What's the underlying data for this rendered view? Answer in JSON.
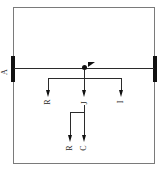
{
  "figure": {
    "background_color": "#ffffff",
    "line_color": "#2b2b2b",
    "marker_color": "#111111",
    "frame_color": "#7a7a7a"
  },
  "markers": {
    "left_bar_label": "A",
    "left_bar": "thick-bar",
    "right_bar": "thick-bar",
    "center_node": "node-dot"
  },
  "branches": {
    "level1": [
      {
        "id": "b1",
        "label": "R"
      },
      {
        "id": "b2",
        "label": "J"
      },
      {
        "id": "b3",
        "label": "I"
      }
    ],
    "level2": [
      {
        "id": "b4",
        "label": "R"
      },
      {
        "id": "b5",
        "label": "C"
      }
    ]
  }
}
